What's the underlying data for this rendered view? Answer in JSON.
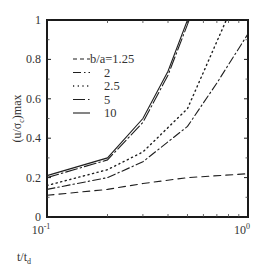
{
  "chart_data": {
    "type": "line",
    "title": "",
    "xlabel": "t/t_d",
    "ylabel": "(u/σ_c)max",
    "xscale": "log",
    "xlim": [
      0.1,
      1.0
    ],
    "ylim": [
      0,
      1
    ],
    "x_ticks": [
      {
        "value": 0.1,
        "label": "10",
        "exp": "-1"
      },
      {
        "value": 1.0,
        "label": "10",
        "exp": "0"
      }
    ],
    "y_ticks": [
      {
        "value": 0,
        "label": "0"
      },
      {
        "value": 0.2,
        "label": "0.2"
      },
      {
        "value": 0.4,
        "label": "0.4"
      },
      {
        "value": 0.6,
        "label": "0.6"
      },
      {
        "value": 0.8,
        "label": "0.8"
      },
      {
        "value": 1,
        "label": "1"
      }
    ],
    "grid": false,
    "legend_position": "upper-left",
    "series": [
      {
        "name": "b/a=1.25",
        "legend_label": "- -b/a=1.25",
        "style": "dashed",
        "x": [
          0.1,
          0.2,
          0.3,
          0.5,
          1.0
        ],
        "values": [
          0.11,
          0.14,
          0.17,
          0.2,
          0.22
        ]
      },
      {
        "name": "2",
        "legend_label": "2",
        "style": "dash-dot",
        "x": [
          0.1,
          0.2,
          0.3,
          0.5,
          0.7,
          1.0
        ],
        "values": [
          0.14,
          0.2,
          0.28,
          0.46,
          0.68,
          0.93
        ]
      },
      {
        "name": "2.5",
        "legend_label": "2.5",
        "style": "dotted",
        "x": [
          0.1,
          0.2,
          0.3,
          0.5,
          0.78
        ],
        "values": [
          0.16,
          0.24,
          0.33,
          0.55,
          1.0
        ]
      },
      {
        "name": "5",
        "legend_label": "5",
        "style": "long-dash-dot",
        "x": [
          0.1,
          0.2,
          0.3,
          0.4,
          0.51
        ],
        "values": [
          0.2,
          0.29,
          0.48,
          0.72,
          1.0
        ]
      },
      {
        "name": "10",
        "legend_label": "10",
        "style": "solid",
        "x": [
          0.1,
          0.2,
          0.3,
          0.4,
          0.5
        ],
        "values": [
          0.21,
          0.3,
          0.5,
          0.74,
          1.0
        ]
      }
    ]
  },
  "labels": {
    "y_axis": "(u/σc)max",
    "x_axis": "t/td"
  }
}
